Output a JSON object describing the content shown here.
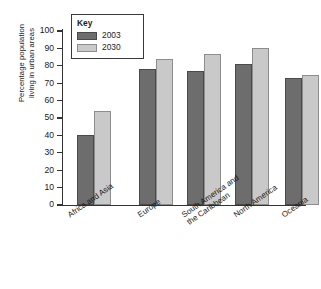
{
  "chart_data": {
    "type": "bar",
    "title": "",
    "xlabel": "",
    "ylabel": "Percentage population living in urban areas",
    "ylabel_line1": "Percentage population",
    "ylabel_line2": "living in urban areas",
    "ylim": [
      0,
      100
    ],
    "ytick_step": 10,
    "ytick_labels": [
      "100",
      "90",
      "80",
      "70",
      "60",
      "50",
      "40",
      "30",
      "20",
      "10",
      "0"
    ],
    "grid": false,
    "legend_position": "top-left-inside",
    "legend_title": "Key",
    "categories": [
      "Africa and Asia",
      "South America and\nthe Caribbean",
      "Europe",
      "North America",
      "Oceania"
    ],
    "category_labels": [
      {
        "line1": "Africa and Asia",
        "line2": ""
      },
      {
        "line1": "Europe",
        "line2": ""
      },
      {
        "line1": "South America and",
        "line2": "the Caribbean"
      },
      {
        "line1": "North America",
        "line2": ""
      },
      {
        "line1": "Oceania",
        "line2": ""
      }
    ],
    "series": [
      {
        "name": "2003",
        "color": "#6d6d6d",
        "values": [
          40,
          78,
          77,
          81,
          73
        ]
      },
      {
        "name": "2030",
        "color": "#c9c9c9",
        "values": [
          54,
          84,
          87,
          90,
          75
        ]
      }
    ]
  }
}
